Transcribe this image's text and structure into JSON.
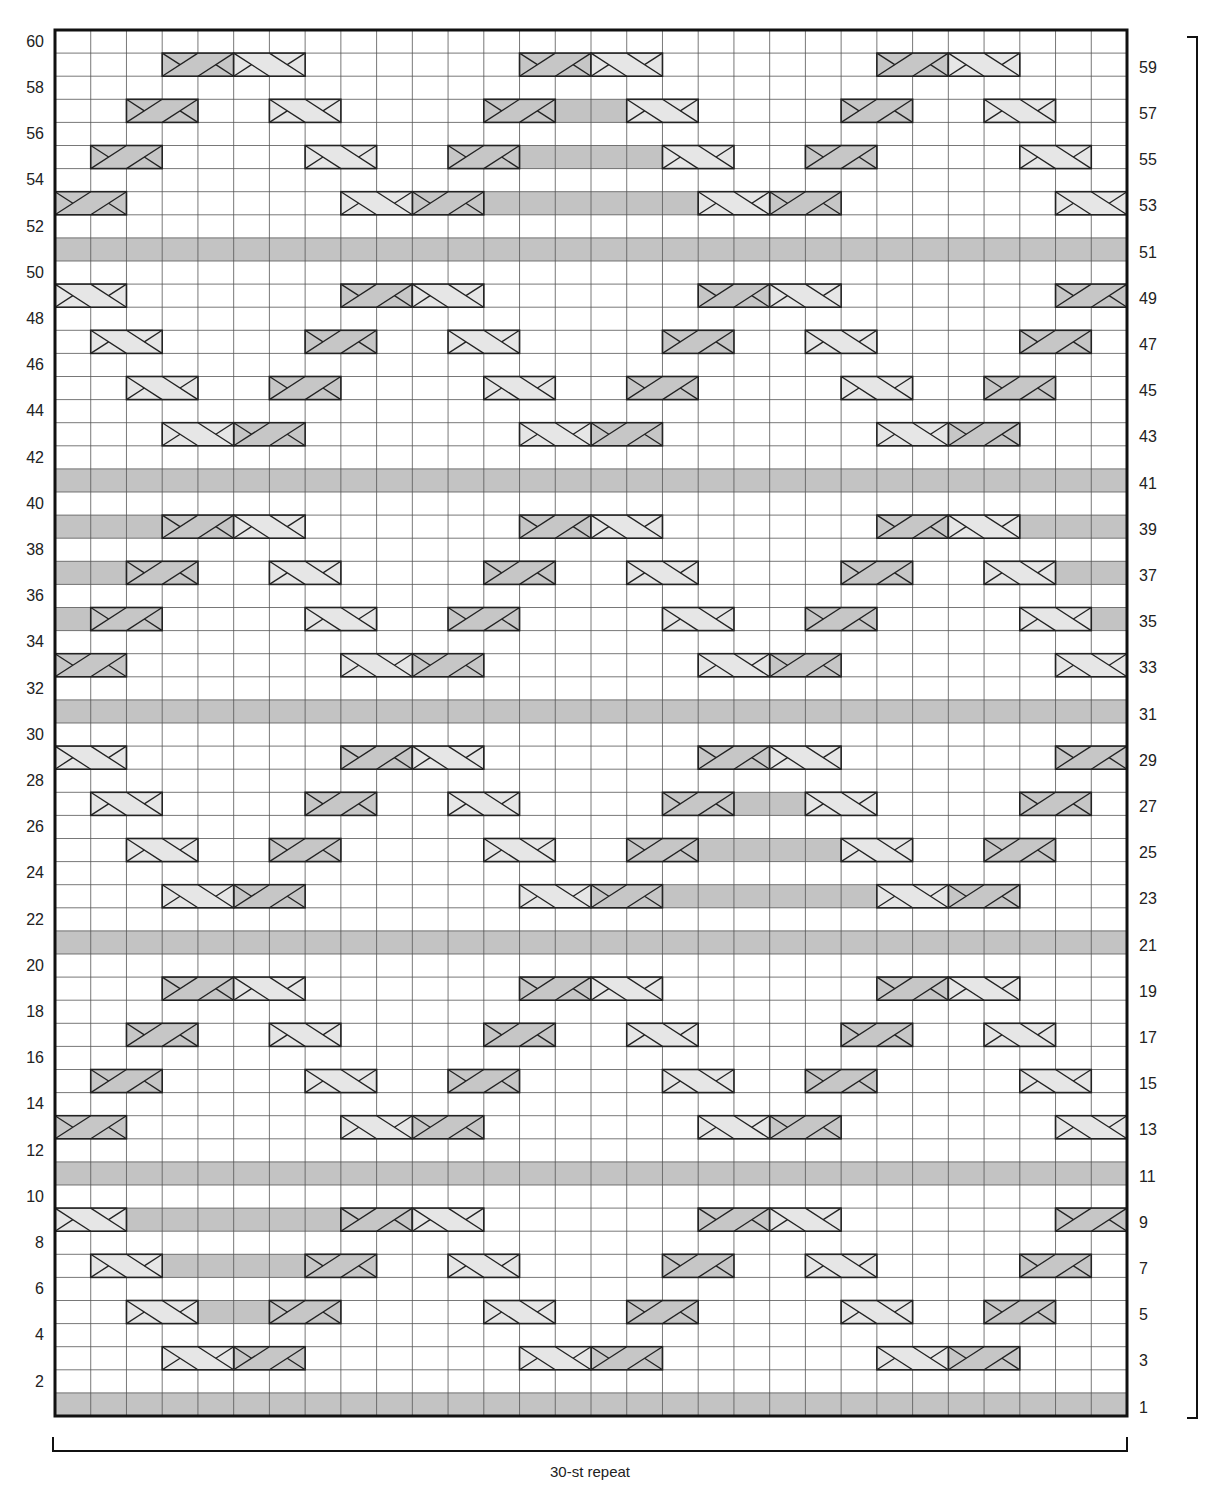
{
  "chart": {
    "stitches": 30,
    "rows": 60,
    "repeat_label": "30-st repeat",
    "colors": {
      "background": "#ffffff",
      "grid_line": "#555555",
      "border": "#111111",
      "purl_fill": "#c3c3c3",
      "left_cross_fill": "#c6c6c6",
      "right_cross_fill": "#e6e6e6"
    },
    "legend_symbols": {
      "blank": "knit (empty square)",
      "P": "purl (grey square)",
      "L": "2-st left cross (dark grey, / band)",
      "R": "2-st right cross (light grey, \\ band)"
    },
    "left_row_labels": [
      "60",
      "58",
      "56",
      "54",
      "52",
      "50",
      "48",
      "46",
      "44",
      "42",
      "40",
      "38",
      "36",
      "34",
      "32",
      "30",
      "28",
      "26",
      "24",
      "22",
      "20",
      "18",
      "16",
      "14",
      "12",
      "10",
      "8",
      "6",
      "4",
      "2"
    ],
    "right_row_labels": [
      "59",
      "57",
      "55",
      "53",
      "51",
      "49",
      "47",
      "45",
      "43",
      "41",
      "39",
      "37",
      "35",
      "33",
      "31",
      "29",
      "27",
      "25",
      "23",
      "21",
      "19",
      "17",
      "15",
      "13",
      "11",
      "9",
      "7",
      "5",
      "3",
      "1"
    ],
    "row_data": {
      "59": {
        "L": [
          4,
          14,
          24
        ],
        "R": [
          6,
          16,
          26
        ],
        "P": []
      },
      "57": {
        "L": [
          3,
          13,
          23
        ],
        "R": [
          7,
          17,
          27
        ],
        "P": [
          [
            15,
            16
          ]
        ]
      },
      "55": {
        "L": [
          2,
          12,
          22
        ],
        "R": [
          8,
          18,
          28
        ],
        "P": [
          [
            14,
            17
          ]
        ]
      },
      "53": {
        "L": [
          1,
          11,
          21
        ],
        "R": [
          9,
          19,
          29
        ],
        "P": [
          [
            13,
            18
          ]
        ]
      },
      "51": {
        "L": [],
        "R": [],
        "P": [
          [
            1,
            30
          ]
        ]
      },
      "49": {
        "L": [
          9,
          19,
          29
        ],
        "R": [
          1,
          11,
          21
        ],
        "P": []
      },
      "47": {
        "L": [
          8,
          18,
          28
        ],
        "R": [
          2,
          12,
          22
        ],
        "P": []
      },
      "45": {
        "L": [
          7,
          17,
          27
        ],
        "R": [
          3,
          13,
          23
        ],
        "P": []
      },
      "43": {
        "L": [
          6,
          16,
          26
        ],
        "R": [
          4,
          14,
          24
        ],
        "P": []
      },
      "41": {
        "L": [],
        "R": [],
        "P": [
          [
            1,
            30
          ]
        ]
      },
      "39": {
        "L": [
          4,
          14,
          24
        ],
        "R": [
          6,
          16,
          26
        ],
        "P": [
          [
            1,
            3
          ],
          [
            28,
            30
          ]
        ]
      },
      "37": {
        "L": [
          3,
          13,
          23
        ],
        "R": [
          7,
          17,
          27
        ],
        "P": [
          [
            1,
            2
          ],
          [
            29,
            30
          ]
        ]
      },
      "35": {
        "L": [
          2,
          12,
          22
        ],
        "R": [
          8,
          18,
          28
        ],
        "P": [
          [
            1,
            1
          ],
          [
            30,
            30
          ]
        ]
      },
      "33": {
        "L": [
          1,
          11,
          21
        ],
        "R": [
          9,
          19,
          29
        ],
        "P": []
      },
      "31": {
        "L": [],
        "R": [],
        "P": [
          [
            1,
            30
          ]
        ]
      },
      "29": {
        "L": [
          9,
          19,
          29
        ],
        "R": [
          1,
          11,
          21
        ],
        "P": []
      },
      "27": {
        "L": [
          8,
          18,
          28
        ],
        "R": [
          2,
          12,
          22
        ],
        "P": [
          [
            20,
            21
          ]
        ]
      },
      "25": {
        "L": [
          7,
          17,
          27
        ],
        "R": [
          3,
          13,
          23
        ],
        "P": [
          [
            19,
            22
          ]
        ]
      },
      "23": {
        "L": [
          6,
          16,
          26
        ],
        "R": [
          4,
          14,
          24
        ],
        "P": [
          [
            18,
            23
          ]
        ]
      },
      "21": {
        "L": [],
        "R": [],
        "P": [
          [
            1,
            30
          ]
        ]
      },
      "19": {
        "L": [
          4,
          14,
          24
        ],
        "R": [
          6,
          16,
          26
        ],
        "P": []
      },
      "17": {
        "L": [
          3,
          13,
          23
        ],
        "R": [
          7,
          17,
          27
        ],
        "P": []
      },
      "15": {
        "L": [
          2,
          12,
          22
        ],
        "R": [
          8,
          18,
          28
        ],
        "P": []
      },
      "13": {
        "L": [
          1,
          11,
          21
        ],
        "R": [
          9,
          19,
          29
        ],
        "P": []
      },
      "11": {
        "L": [],
        "R": [],
        "P": [
          [
            1,
            30
          ]
        ]
      },
      "9": {
        "L": [
          9,
          19,
          29
        ],
        "R": [
          1,
          11,
          21
        ],
        "P": [
          [
            3,
            8
          ]
        ]
      },
      "7": {
        "L": [
          8,
          18,
          28
        ],
        "R": [
          2,
          12,
          22
        ],
        "P": [
          [
            4,
            7
          ]
        ]
      },
      "5": {
        "L": [
          7,
          17,
          27
        ],
        "R": [
          3,
          13,
          23
        ],
        "P": [
          [
            5,
            6
          ]
        ]
      },
      "3": {
        "L": [
          6,
          16,
          26
        ],
        "R": [
          4,
          14,
          24
        ],
        "P": []
      },
      "1": {
        "L": [],
        "R": [],
        "P": [
          [
            1,
            30
          ]
        ]
      }
    }
  }
}
